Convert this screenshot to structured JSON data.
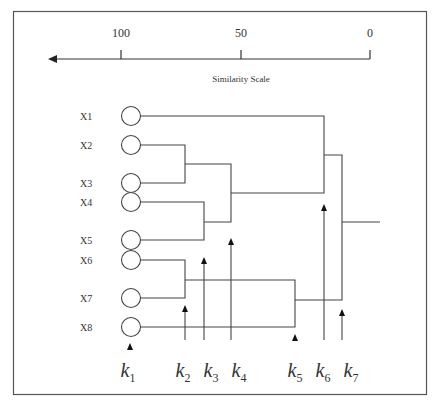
{
  "axis": {
    "title": "Similarity Scale",
    "ticks": [
      {
        "label": "100",
        "x": 121
      },
      {
        "label": "50",
        "x": 241
      },
      {
        "label": "0",
        "x": 370
      }
    ]
  },
  "leaves": [
    {
      "label": "X1",
      "y": 116
    },
    {
      "label": "X2",
      "y": 145
    },
    {
      "label": "X3",
      "y": 183
    },
    {
      "label": "X4",
      "y": 202
    },
    {
      "label": "X5",
      "y": 240
    },
    {
      "label": "X6",
      "y": 260
    },
    {
      "label": "X7",
      "y": 298
    },
    {
      "label": "X8",
      "y": 327
    }
  ],
  "cut_levels": [
    {
      "label": "k",
      "sub": "1",
      "x": 130
    },
    {
      "label": "k",
      "sub": "2",
      "x": 185
    },
    {
      "label": "k",
      "sub": "3",
      "x": 204
    },
    {
      "label": "k",
      "sub": "4",
      "x": 231
    },
    {
      "label": "k",
      "sub": "5",
      "x": 295
    },
    {
      "label": "k",
      "sub": "6",
      "x": 324
    },
    {
      "label": "k",
      "sub": "7",
      "x": 342
    }
  ]
}
